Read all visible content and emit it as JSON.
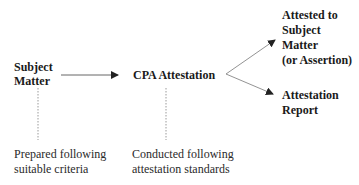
{
  "diagram": {
    "nodes": {
      "subject_matter": {
        "lines": [
          "Subject",
          "Matter"
        ]
      },
      "cpa_attestation": {
        "label": "CPA Attestation"
      },
      "attested_to": {
        "lines": [
          "Attested to",
          "Subject",
          "Matter",
          "(or Assertion)"
        ]
      },
      "attestation_report": {
        "lines": [
          "Attestation",
          "Report"
        ]
      }
    },
    "notes": {
      "subject_matter_note": {
        "lines": [
          "Prepared following",
          "suitable criteria"
        ]
      },
      "cpa_attestation_note": {
        "lines": [
          "Conducted following",
          "attestation standards"
        ]
      }
    },
    "edges": [
      {
        "from": "subject_matter",
        "to": "cpa_attestation",
        "style": "solid-arrow"
      },
      {
        "from": "cpa_attestation",
        "to": "attested_to",
        "style": "solid-arrow"
      },
      {
        "from": "cpa_attestation",
        "to": "attestation_report",
        "style": "solid-arrow"
      },
      {
        "from": "subject_matter",
        "to": "subject_matter_note",
        "style": "dotted"
      },
      {
        "from": "cpa_attestation",
        "to": "cpa_attestation_note",
        "style": "dotted"
      }
    ],
    "colors": {
      "line": "#555555",
      "dotted": "#9a9a9a",
      "text": "#1a1a1a"
    }
  }
}
